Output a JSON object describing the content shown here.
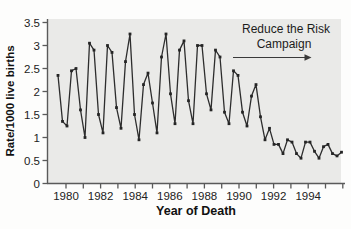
{
  "chart_data": {
    "type": "line",
    "title": "",
    "xlabel": "Year of Death",
    "ylabel": "Rate/1000 live births",
    "ylim": [
      0,
      3.5
    ],
    "y_tick_labels": [
      "0",
      "0.5",
      "1",
      "1.5",
      "2",
      "2.5",
      "3",
      "3.5"
    ],
    "y_tick_values": [
      0,
      0.5,
      1,
      1.5,
      2,
      2.5,
      3,
      3.5
    ],
    "x_tick_years": [
      1980,
      1981,
      1982,
      1983,
      1984,
      1985,
      1986,
      1987,
      1988,
      1989,
      1990,
      1991,
      1992,
      1993,
      1994,
      1995,
      1996
    ],
    "x_labeled_years": [
      1980,
      1982,
      1984,
      1986,
      1988,
      1990,
      1992,
      1994
    ],
    "grid": false,
    "legend": "none",
    "annotation": {
      "line1": "Reduce the Risk",
      "line2": "Campaign",
      "arrow_direction": "right"
    },
    "series": [
      {
        "name": "SIDS rate per 1000 live births (quarterly)",
        "start_year": 1980,
        "points_per_year": 4,
        "values": [
          2.35,
          1.35,
          1.25,
          2.45,
          2.5,
          1.6,
          1.0,
          3.05,
          2.9,
          1.5,
          1.1,
          3.0,
          2.85,
          1.65,
          1.2,
          2.65,
          3.25,
          1.5,
          0.95,
          2.15,
          2.4,
          1.75,
          1.1,
          2.75,
          3.25,
          1.95,
          1.3,
          2.9,
          3.1,
          1.8,
          1.3,
          3.0,
          3.0,
          1.95,
          1.6,
          2.9,
          2.75,
          1.55,
          1.3,
          2.45,
          2.35,
          1.55,
          1.25,
          1.9,
          2.15,
          1.45,
          0.95,
          1.2,
          0.85,
          0.85,
          0.65,
          0.95,
          0.9,
          0.65,
          0.55,
          0.9,
          0.9,
          0.7,
          0.55,
          0.8,
          0.85,
          0.65,
          0.6,
          0.68
        ]
      }
    ],
    "colors": {
      "line": "#2d2d2d",
      "marker": "#252525",
      "plot_background": "#eaeae8",
      "axis": "#5a5a5a",
      "text": "#1a1a1a"
    }
  }
}
